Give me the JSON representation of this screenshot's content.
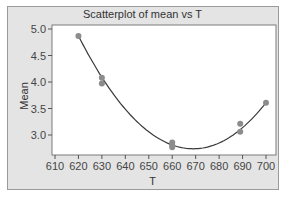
{
  "chart_data": {
    "type": "scatter",
    "title": "Scatterplot of mean vs T",
    "xlabel": "T",
    "ylabel": "Mean",
    "xlim": [
      607,
      703
    ],
    "ylim": [
      2.6,
      5.1
    ],
    "x_ticks": [
      610,
      620,
      630,
      640,
      650,
      660,
      670,
      680,
      690,
      700
    ],
    "y_ticks": [
      3.0,
      3.5,
      4.0,
      4.5,
      5.0
    ],
    "x_tick_labels": [
      "610",
      "620",
      "630",
      "640",
      "650",
      "660",
      "670",
      "680",
      "690",
      "700"
    ],
    "y_tick_labels": [
      "3.0",
      "3.5",
      "4.0",
      "4.5",
      "5.0"
    ],
    "grid": false,
    "legend": null,
    "series": [
      {
        "name": "mean",
        "x": [
          620,
          630,
          630,
          660,
          660,
          660,
          689,
          689,
          700
        ],
        "y": [
          4.87,
          4.08,
          3.97,
          2.86,
          2.8,
          2.77,
          3.21,
          3.06,
          3.61
        ]
      }
    ],
    "fit_curve": {
      "type": "quadratic",
      "description": "smooth fitted curve through points, minimum near T=669, Mean≈2.74",
      "points": [
        [
          620,
          4.87
        ],
        [
          630,
          4.02
        ],
        [
          640,
          3.4
        ],
        [
          650,
          2.99
        ],
        [
          660,
          2.79
        ],
        [
          670,
          2.74
        ],
        [
          680,
          2.86
        ],
        [
          690,
          3.15
        ],
        [
          700,
          3.61
        ]
      ]
    },
    "colors": {
      "points": "#8c8c8c",
      "curve": "#3a3a3a",
      "panel": "#e4e4e4",
      "plot_bg": "#ffffff"
    }
  }
}
